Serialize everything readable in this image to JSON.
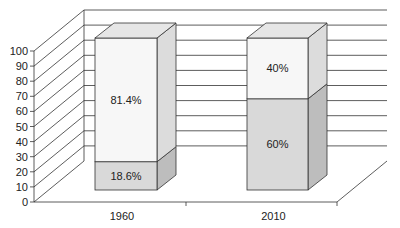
{
  "chart_data": {
    "type": "bar",
    "stacked": true,
    "three_d": true,
    "title": "",
    "xlabel": "",
    "ylabel": "",
    "ylim": [
      0,
      100
    ],
    "yticks": [
      0,
      10,
      20,
      30,
      40,
      50,
      60,
      70,
      80,
      90,
      100
    ],
    "categories": [
      "1960",
      "2010"
    ],
    "series": [
      {
        "name": "bottom",
        "values": [
          18.6,
          60
        ],
        "labels": [
          "18.6%",
          "60%"
        ],
        "color": "#d9d9d9"
      },
      {
        "name": "top",
        "values": [
          81.4,
          40
        ],
        "labels": [
          "81.4%",
          "40%"
        ],
        "color": "#f7f7f7"
      }
    ],
    "grid": true,
    "legend": null
  },
  "axis": {
    "y_tick_labels": [
      "0",
      "10",
      "20",
      "30",
      "40",
      "50",
      "60",
      "70",
      "80",
      "90",
      "100"
    ],
    "x_tick_labels": [
      "1960",
      "2010"
    ]
  }
}
